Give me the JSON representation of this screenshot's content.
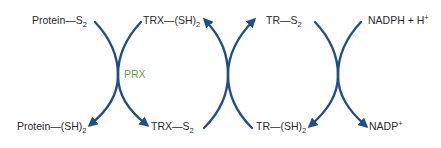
{
  "diagram": {
    "arrow_color": "#1f4f8a",
    "enzyme_color": "#6a9a4a",
    "enzyme_label": "PRX",
    "top_labels": [
      {
        "main": "Protein—S",
        "sub": "2",
        "sup": ""
      },
      {
        "main": "TRX—(SH)",
        "sub": "2",
        "sup": ""
      },
      {
        "main": "TR—S",
        "sub": "2",
        "sup": ""
      },
      {
        "main": "NADPH + H",
        "sub": "",
        "sup": "+"
      }
    ],
    "bottom_labels": [
      {
        "main": "Protein—(SH)",
        "sub": "2",
        "sup": ""
      },
      {
        "main": "TRX—S",
        "sub": "2",
        "sup": ""
      },
      {
        "main": "TR—(SH)",
        "sub": "2",
        "sup": ""
      },
      {
        "main": "NADP",
        "sub": "",
        "sup": "+"
      }
    ],
    "reactions": [
      {
        "name": "peroxiredoxin-reaction",
        "direction": "down",
        "from": [
          "Protein—S2",
          "TRX—(SH)2"
        ],
        "to": [
          "Protein—(SH)2",
          "TRX—S2"
        ],
        "enzyme": "PRX"
      },
      {
        "name": "thioredoxin-reductase-reaction",
        "direction": "up",
        "from": [
          "TRX—S2",
          "TR—(SH)2"
        ],
        "to": [
          "TRX—(SH)2",
          "TR—S2"
        ]
      },
      {
        "name": "nadph-reaction",
        "direction": "down",
        "from": [
          "TR—S2",
          "NADPH + H+"
        ],
        "to": [
          "TR—(SH)2",
          "NADP+"
        ]
      }
    ]
  }
}
